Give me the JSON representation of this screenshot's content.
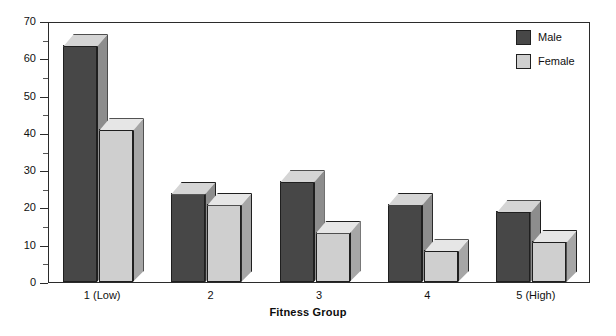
{
  "chart_data": {
    "type": "bar",
    "title": "",
    "subtitle": "",
    "xlabel": "Fitness Group",
    "ylabel": "",
    "categories": [
      "1 (Low)",
      "2",
      "3",
      "4",
      "5 (High)"
    ],
    "series": [
      {
        "name": "Male",
        "color": "#474747",
        "values": [
          63.5,
          24,
          27,
          21,
          19
        ]
      },
      {
        "name": "Female",
        "color": "#cfcfcf",
        "values": [
          41,
          21,
          13.5,
          8.5,
          11
        ]
      }
    ],
    "ylim": [
      0,
      70
    ],
    "yticks": [
      0,
      10,
      20,
      30,
      40,
      50,
      60,
      70
    ],
    "ytick_labels": [
      "0",
      "10",
      "20",
      "30",
      "40",
      "50",
      "60",
      "70"
    ],
    "yminor_ticks": [
      5,
      15,
      25,
      35,
      45,
      55,
      65
    ],
    "grid": false,
    "legend_position": "top-right",
    "style": "3d-bar",
    "frame": true
  },
  "legend": {
    "entries": [
      {
        "label": "Male"
      },
      {
        "label": "Female"
      }
    ]
  },
  "axes": {
    "x_title": "Fitness Group"
  },
  "colors": {
    "male_front": "#474747",
    "male_side": "#8d8d8d",
    "male_top": "#d5d5d5",
    "female_front": "#cfcfcf",
    "female_side": "#a6a6a6",
    "female_top": "#e6e6e6",
    "axis": "#2b2b2b",
    "background": "#ffffff"
  }
}
